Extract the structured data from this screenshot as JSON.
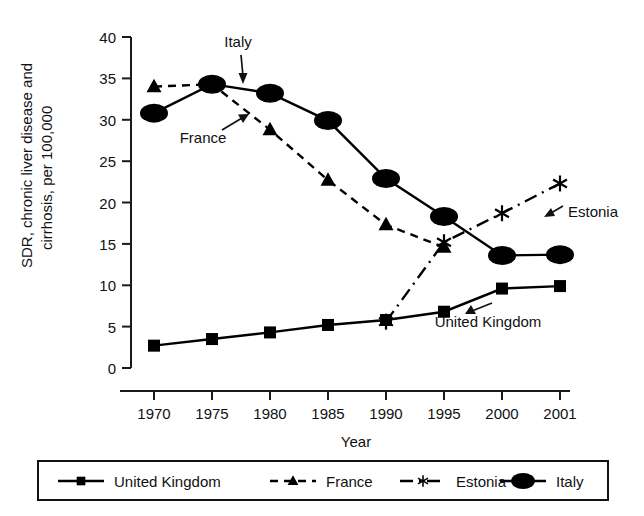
{
  "chart_data": {
    "type": "line",
    "title": "",
    "xlabel": "Year",
    "ylabel": "SDR, chronic liver disease and cirrhosis, per 100,000",
    "x": [
      1970,
      1975,
      1980,
      1985,
      1990,
      1995,
      2000,
      2001
    ],
    "xticklabels": [
      "1970",
      "1975",
      "1980",
      "1985",
      "1990",
      "1995",
      "2000",
      "2001"
    ],
    "yticklabels": [
      "0",
      "5",
      "10",
      "15",
      "20",
      "25",
      "30",
      "35",
      "40"
    ],
    "yticks": [
      0,
      5,
      10,
      15,
      20,
      25,
      30,
      35,
      40
    ],
    "ylim": [
      0,
      40
    ],
    "grid": false,
    "legend_position": "bottom",
    "series": [
      {
        "name": "United Kingdom",
        "marker": "square",
        "linestyle": "solid",
        "color": "#000000",
        "x": [
          1970,
          1975,
          1980,
          1985,
          1990,
          1995,
          2000,
          2001
        ],
        "values": [
          2.7,
          3.5,
          4.3,
          5.2,
          5.8,
          6.8,
          9.6,
          9.9
        ]
      },
      {
        "name": "France",
        "marker": "triangle",
        "linestyle": "dashed",
        "color": "#000000",
        "x": [
          1970,
          1975,
          1980,
          1985,
          1990,
          1995
        ],
        "values": [
          34.0,
          34.3,
          28.8,
          22.7,
          17.3,
          14.6
        ]
      },
      {
        "name": "Estonia",
        "marker": "asterisk",
        "linestyle": "dashdot",
        "color": "#000000",
        "x": [
          1990,
          1995,
          2000,
          2001
        ],
        "values": [
          5.6,
          15.2,
          18.7,
          22.3
        ]
      },
      {
        "name": "Italy",
        "marker": "ellipse",
        "linestyle": "solid",
        "color": "#000000",
        "x": [
          1970,
          1975,
          1980,
          1985,
          1990,
          1995,
          2000,
          2001
        ],
        "values": [
          30.8,
          34.3,
          33.2,
          29.9,
          22.9,
          18.3,
          13.6,
          13.7
        ]
      }
    ],
    "annotations": [
      {
        "text": "Italy",
        "points_to": "Italy 1980 point"
      },
      {
        "text": "France",
        "points_to": "France 1985 segment"
      },
      {
        "text": "Estonia",
        "points_to": "Estonia 2001 point"
      },
      {
        "text": "United Kingdom",
        "points_to": "United Kingdom 2000 point"
      }
    ]
  },
  "legend": {
    "items": [
      {
        "label": "United Kingdom",
        "marker": "square",
        "linestyle": "solid"
      },
      {
        "label": "France",
        "marker": "triangle",
        "linestyle": "dashed"
      },
      {
        "label": "Estonia",
        "marker": "asterisk",
        "linestyle": "dashdot"
      },
      {
        "label": "Italy",
        "marker": "ellipse",
        "linestyle": "solid"
      }
    ]
  }
}
